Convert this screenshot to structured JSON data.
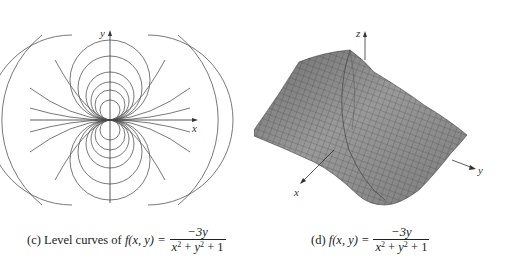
{
  "panels": [
    {
      "id": "c",
      "type": "contour-plot",
      "caption": {
        "prefix": "(c) Level curves of",
        "func": "f(x, y) =",
        "numerator": "−3y",
        "denominator_x": "x",
        "denominator_y": "y",
        "denominator_tail": "+ 1",
        "exp": "2"
      },
      "axes": {
        "x_label": "x",
        "y_label": "y"
      }
    },
    {
      "id": "d",
      "type": "surface-plot",
      "caption": {
        "prefix": "(d)",
        "func": "f(x, y) =",
        "numerator": "−3y",
        "denominator_x": "x",
        "denominator_y": "y",
        "denominator_tail": "+ 1",
        "exp": "2"
      },
      "axes": {
        "x_label": "x",
        "y_label": "y",
        "z_label": "z"
      }
    }
  ],
  "colors": {
    "line": "#555555",
    "surface": "#8a8a8a",
    "mesh": "#333333",
    "axis": "#333333"
  }
}
